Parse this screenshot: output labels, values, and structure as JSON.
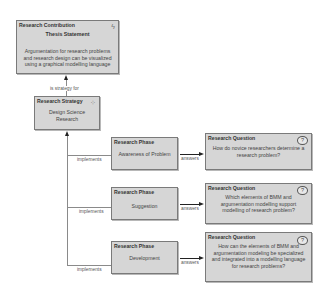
{
  "contribution": {
    "type": "Research Contribution",
    "title": "Thesis Statement",
    "body": "Argumentation for research problems and research design can be visualized using a graphical modelling language",
    "icon": "lightning-icon"
  },
  "strategy_relation": "is strategy for",
  "strategy": {
    "type": "Research Strategy",
    "body": "Design Science Research",
    "icon": "network-icon"
  },
  "phases": [
    {
      "type": "Research Phase",
      "body": "Awareness of Problem",
      "implements_label": "implements",
      "answers_label": "answers"
    },
    {
      "type": "Research Phase",
      "body": "Suggestion",
      "implements_label": "implements",
      "answers_label": "answers"
    },
    {
      "type": "Research Phase",
      "body": "Development",
      "implements_label": "implements",
      "answers_label": "answers"
    }
  ],
  "questions": [
    {
      "type": "Research Question",
      "body": "How do novice researchers determine a research problem?",
      "icon_glyph": "?"
    },
    {
      "type": "Research Question",
      "body": "Which elements of BMM and argumentation modelling support modelling of research problem?",
      "icon_glyph": "?"
    },
    {
      "type": "Research Question",
      "body": "How can the elements of BMM and argumentation modeling be specialized and integrated into a modelling language for research problems?",
      "icon_glyph": "?"
    }
  ],
  "icons": {
    "lightning": "ϟ",
    "network": "⁘"
  }
}
